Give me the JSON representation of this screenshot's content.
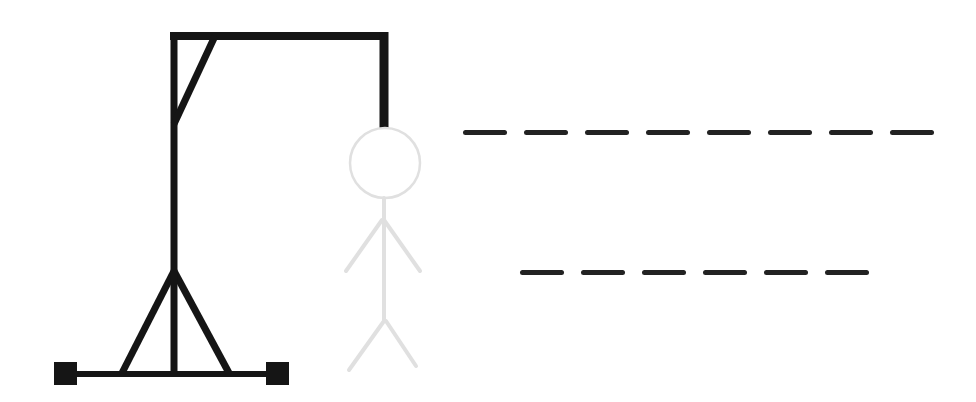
{
  "game": {
    "type": "hangman",
    "colors": {
      "gallows": "#151515",
      "figure_hidden": "#e0e0e0",
      "dash": "#222222",
      "background": "#ffffff"
    },
    "figure_parts": [
      "head",
      "body",
      "left-arm",
      "right-arm",
      "left-leg",
      "right-leg"
    ],
    "figure_parts_revealed": 0,
    "words": [
      {
        "length": 8,
        "letters": [
          "",
          "",
          "",
          "",
          "",
          "",
          "",
          ""
        ]
      },
      {
        "length": 6,
        "letters": [
          "",
          "",
          "",
          "",
          "",
          ""
        ]
      }
    ]
  }
}
